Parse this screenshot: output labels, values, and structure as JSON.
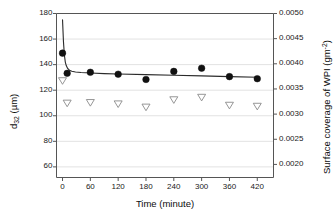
{
  "chart_data": {
    "type": "scatter",
    "title": "",
    "xlabel": "Time (minute)",
    "ylabel": "d32 (µm)",
    "ylabel_right": "Surface coverage of WPI (gm-2)",
    "xlim": [
      -13,
      455
    ],
    "ylim": [
      51.7,
      180
    ],
    "ylim_right": [
      0.00174,
      0.005
    ],
    "xticks": [
      0,
      60,
      120,
      180,
      240,
      300,
      360,
      420
    ],
    "xtick_labels": [
      "0",
      "60",
      "120",
      "180",
      "240",
      "300",
      "360",
      "420"
    ],
    "yticks": [
      60,
      80,
      100,
      120,
      140,
      160,
      180
    ],
    "ytick_labels": [
      "60",
      "80",
      "100",
      "120",
      "140",
      "160",
      "180"
    ],
    "yticks_right": [
      0.002,
      0.0025,
      0.003,
      0.0035,
      0.004,
      0.0045,
      0.005
    ],
    "ytick_labels_right": [
      "0.0020",
      "0.0025",
      "0.0030",
      "0.0035",
      "0.0040",
      "0.0045",
      "0.0050"
    ],
    "grid": "horizontal-major-light",
    "legend": "none",
    "series": [
      {
        "name": "d32 (µm)",
        "marker": "filled-circle",
        "axis": "left",
        "x": [
          0,
          10,
          60,
          120,
          180,
          240,
          300,
          360,
          420
        ],
        "values": [
          149.0,
          133.2,
          134.0,
          132.5,
          128.4,
          134.7,
          137.2,
          130.6,
          129.0
        ]
      },
      {
        "name": "Surface coverage of WPI (gm-2)",
        "marker": "open-down-triangle",
        "axis": "right",
        "x": [
          0,
          10,
          60,
          120,
          180,
          240,
          300,
          360,
          420
        ],
        "values": [
          0.00366,
          0.003214,
          0.003226,
          0.003199,
          0.003135,
          0.003281,
          0.00333,
          0.003172,
          0.003152
        ]
      },
      {
        "name": "fitted-curve",
        "marker": "line",
        "axis": "left",
        "x": [
          0,
          2,
          4,
          6,
          8,
          11,
          15,
          20,
          28,
          40,
          60,
          90,
          120,
          180,
          240,
          300,
          360,
          420
        ],
        "values": [
          175.0,
          158.0,
          147.5,
          142.0,
          139.3,
          137.0,
          135.6,
          134.8,
          134.2,
          133.8,
          133.4,
          133.0,
          132.7,
          132.2,
          131.7,
          131.2,
          130.6,
          130.1
        ]
      }
    ]
  },
  "axis_titles": {
    "x": "Time (minute)",
    "y_left_main": "d",
    "y_left_sub": "32",
    "y_left_unit": " (µm)",
    "y_right_main": "Surface coverage of WPI (gm",
    "y_right_sup": "-2",
    "y_right_close": ")"
  },
  "colors": {
    "marker_filled": "#111111",
    "marker_open_edge": "#8a8a8a",
    "curve": "#2b2b2b",
    "axis": "#555555",
    "grid": "#e2e2e2",
    "text": "#111111",
    "background": "#ffffff"
  }
}
